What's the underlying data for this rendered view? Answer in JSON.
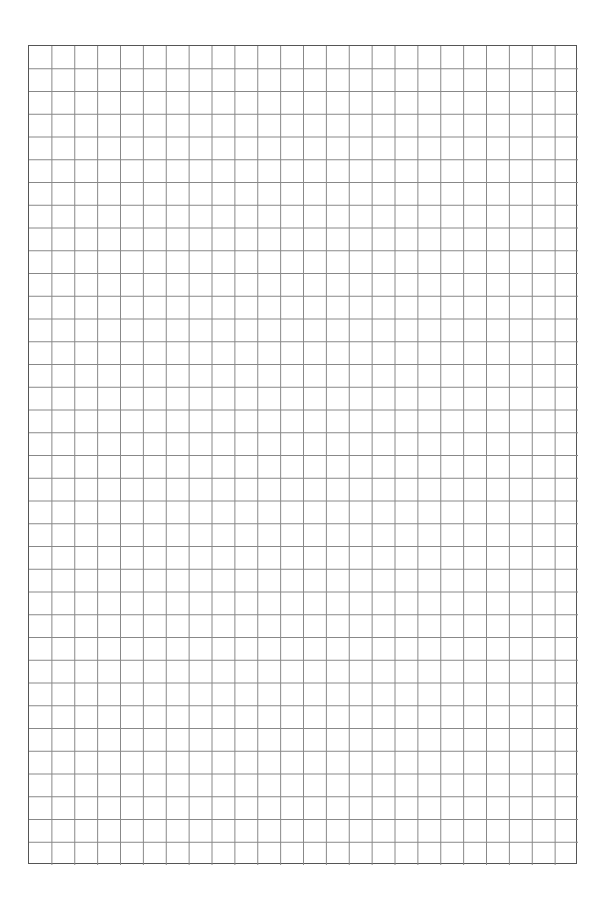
{
  "sheet": {
    "type": "graph-paper",
    "columns": 24,
    "rows": 36,
    "line_color": "#888888",
    "border_color": "#555555",
    "background": "#ffffff"
  }
}
